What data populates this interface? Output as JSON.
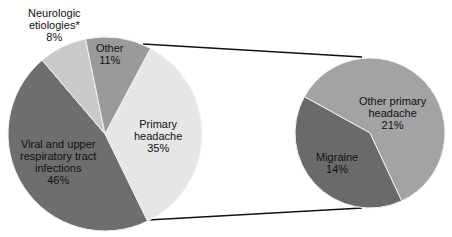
{
  "chart_data": [
    {
      "type": "pie",
      "title": "",
      "labels": [
        "Primary headache",
        "Viral and upper respiratory tract infections",
        "Neurologic etiologies*",
        "Other"
      ],
      "values": [
        35,
        46,
        8,
        11
      ],
      "colors": [
        "#e6e6e6",
        "#6e6e6e",
        "#c9c9c9",
        "#9a9a9a"
      ]
    },
    {
      "type": "pie",
      "title": "",
      "exploded_from": "Primary headache",
      "labels": [
        "Other primary headache",
        "Migraine"
      ],
      "values": [
        21,
        14
      ],
      "colors": [
        "#a3a3a3",
        "#6a6a6a"
      ]
    }
  ],
  "labels": {
    "neuro_l1": "Neurologic",
    "neuro_l2": "etiologies*",
    "neuro_pct": "8%",
    "other_l1": "Other",
    "other_pct": "11%",
    "primary_l1": "Primary",
    "primary_l2": "headache",
    "primary_pct": "35%",
    "viral_l1": "Viral and upper",
    "viral_l2": "respiratory tract",
    "viral_l3": "infections",
    "viral_pct": "46%",
    "otherprim_l1": "Other primary",
    "otherprim_l2": "headache",
    "otherprim_pct": "21%",
    "migraine_l1": "Migraine",
    "migraine_pct": "14%"
  }
}
